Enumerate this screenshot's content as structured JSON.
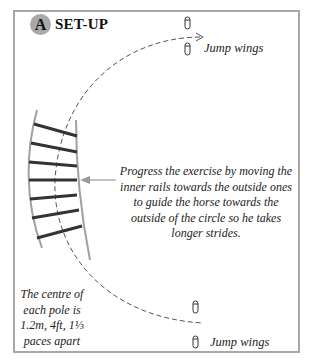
{
  "header": {
    "badge_letter": "A",
    "title": "SET-UP"
  },
  "labels": {
    "jump_wings_top": "Jump wings",
    "jump_wings_bottom": "Jump wings",
    "progress_note": "Progress the exercise by moving the inner rails towards the outside ones to guide the horse towards the outside of the circle so he takes longer strides.",
    "spacing_note": "The centre of each pole is 1.2m, 4ft, 1⅓ paces apart"
  },
  "diagram": {
    "pole_count": 7,
    "frame_color": "#a8a8a8",
    "pole_color": "#333333",
    "rail_color": "#a0a0a0",
    "path_color": "#555555",
    "arrow_color": "#999999",
    "badge_color": "#a9a9a9"
  }
}
